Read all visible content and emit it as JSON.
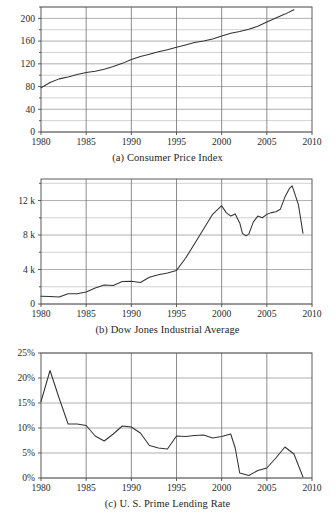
{
  "figure": {
    "title": "",
    "panel_count": 3
  },
  "chart_data": [
    {
      "id": "cpi",
      "type": "line",
      "title": "(a) Consumer Price Index",
      "caption": "(a) Consumer Price Index",
      "xlabel": "",
      "ylabel": "",
      "xlim": [
        1980,
        2010
      ],
      "ylim": [
        0,
        220
      ],
      "xticks": [
        1980,
        1985,
        1990,
        1995,
        2000,
        2005,
        2010
      ],
      "xticklabels": [
        "1980",
        "1985",
        "1990",
        "1995",
        "2000",
        "2005",
        "2010"
      ],
      "yticks": [
        0,
        40,
        80,
        120,
        160,
        200
      ],
      "yticklabels": [
        "0",
        "40",
        "80",
        "120",
        "160",
        "200"
      ],
      "y_minor_ticks": [
        20,
        60,
        100,
        140,
        180,
        220
      ],
      "grid": true,
      "legend": null,
      "x": [
        1980,
        1981,
        1982,
        1983,
        1984,
        1985,
        1986,
        1987,
        1988,
        1989,
        1990,
        1991,
        1992,
        1993,
        1994,
        1995,
        1996,
        1997,
        1998,
        1999,
        2000,
        2001,
        2002,
        2003,
        2004,
        2005,
        2006,
        2007,
        2008
      ],
      "values": [
        78.0,
        87.2,
        93.5,
        97.0,
        101.0,
        104.7,
        106.8,
        110.6,
        115.2,
        120.8,
        127.5,
        133.0,
        137.0,
        141.1,
        144.9,
        149.0,
        153.3,
        157.4,
        160.0,
        163.5,
        169.0,
        173.8,
        177.0,
        181.0,
        186.0,
        193.5,
        200.5,
        207.5,
        215.0
      ],
      "notes": "Annual CPI index values, 1980-2008, rising steadily"
    },
    {
      "id": "djia",
      "type": "line",
      "title": "(b) Dow Jones Industrial Average",
      "caption": "(b) Dow Jones Industrial Average",
      "xlabel": "",
      "ylabel": "",
      "xlim": [
        1980,
        2010
      ],
      "ylim": [
        0,
        14500
      ],
      "xticks": [
        1980,
        1985,
        1990,
        1995,
        2000,
        2005,
        2010
      ],
      "xticklabels": [
        "1980",
        "1985",
        "1990",
        "1995",
        "2000",
        "2005",
        "2010"
      ],
      "yticks": [
        0,
        4000,
        8000,
        12000
      ],
      "yticklabels": [
        "0",
        "4 k",
        "8 k",
        "12 k"
      ],
      "y_minor_ticks": [
        2000,
        6000,
        10000,
        14000
      ],
      "grid": true,
      "legend": null,
      "x": [
        1980.0,
        1981.0,
        1982.0,
        1983.0,
        1984.0,
        1985.0,
        1986.0,
        1987.0,
        1988.0,
        1989.0,
        1990.0,
        1991.0,
        1992.0,
        1993.0,
        1994.0,
        1995.0,
        1996.0,
        1997.0,
        1998.0,
        1999.0,
        2000.0,
        2000.5,
        2001.0,
        2001.5,
        2002.0,
        2002.3,
        2002.7,
        2003.0,
        2003.5,
        2004.0,
        2004.5,
        2005.0,
        2005.5,
        2006.0,
        2006.5,
        2007.0,
        2007.5,
        2007.8,
        2008.0,
        2008.5,
        2009.0
      ],
      "values": [
        900,
        875,
        800,
        1200,
        1200,
        1400,
        1850,
        2200,
        2150,
        2600,
        2650,
        2500,
        3100,
        3400,
        3600,
        3900,
        5300,
        7000,
        8700,
        10400,
        11400,
        10600,
        10200,
        10450,
        9400,
        8200,
        7900,
        8100,
        9500,
        10200,
        10000,
        10400,
        10600,
        10700,
        11000,
        12400,
        13400,
        13700,
        13100,
        11500,
        8200
      ],
      "notes": "Annual Dow Jones index, peak ~11.4k in 2000, dip to ~7.9k in 2002-03, peak ~13.7k in 2007, crash to ~8.2k in 2009"
    },
    {
      "id": "prime",
      "type": "line",
      "title": "(c) U. S. Prime Lending Rate",
      "caption": "(c) U. S. Prime Lending Rate",
      "xlabel": "",
      "ylabel": "",
      "xlim": [
        1980,
        2010
      ],
      "ylim": [
        0,
        25
      ],
      "xticks": [
        1980,
        1985,
        1990,
        1995,
        2000,
        2005,
        2010
      ],
      "xticklabels": [
        "1980",
        "1985",
        "1990",
        "1995",
        "2000",
        "2005",
        "2010"
      ],
      "yticks": [
        0,
        5,
        10,
        15,
        20,
        25
      ],
      "yticklabels": [
        "0%",
        "5%",
        "10%",
        "15%",
        "20%",
        "25%"
      ],
      "grid": true,
      "legend": null,
      "x": [
        1980,
        1981,
        1982,
        1983,
        1984,
        1985,
        1986,
        1987,
        1988,
        1989,
        1990,
        1991,
        1992,
        1993,
        1994,
        1995,
        1996,
        1997,
        1998,
        1999,
        2000,
        2001,
        2001.5,
        2002,
        2003,
        2004,
        2005,
        2006,
        2007,
        2008,
        2009
      ],
      "values": [
        15.3,
        21.5,
        16.0,
        10.8,
        10.8,
        10.5,
        8.4,
        7.4,
        8.8,
        10.4,
        10.2,
        9.0,
        6.5,
        6.0,
        5.8,
        8.4,
        8.3,
        8.5,
        8.6,
        8.0,
        8.3,
        8.8,
        6.0,
        1.0,
        0.5,
        1.5,
        2.0,
        4.0,
        6.2,
        4.8,
        0.2
      ],
      "notes": "U.S. prime lending rate percent, peak 21.5% in 1981, falls to near 0.5% in 2003 and 0.2% in 2009"
    }
  ]
}
